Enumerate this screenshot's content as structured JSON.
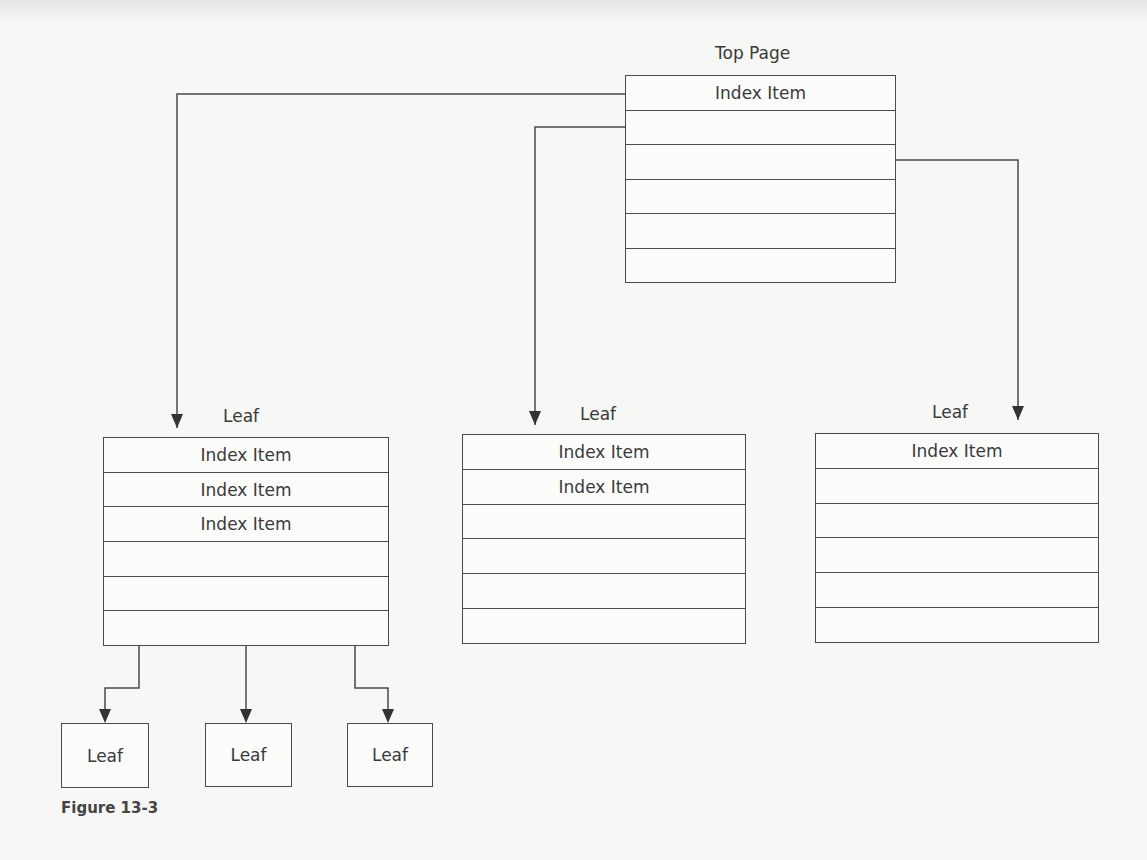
{
  "figure": {
    "caption": "Figure 13-3",
    "colors": {
      "line": "#4a4a4a",
      "text": "#3a3a3a",
      "background": "#f7f7f5"
    }
  },
  "top_page": {
    "title": "Top Page",
    "rows": [
      "Index Item",
      "",
      "",
      "",
      "",
      ""
    ]
  },
  "leaf_pages": [
    {
      "title": "Leaf",
      "rows": [
        "Index Item",
        "Index Item",
        "Index Item",
        "",
        "",
        ""
      ]
    },
    {
      "title": "Leaf",
      "rows": [
        "Index Item",
        "Index Item",
        "",
        "",
        "",
        ""
      ]
    },
    {
      "title": "Leaf",
      "rows": [
        "Index Item",
        "",
        "",
        "",
        "",
        ""
      ]
    }
  ],
  "child_leaves": [
    {
      "label": "Leaf"
    },
    {
      "label": "Leaf"
    },
    {
      "label": "Leaf"
    }
  ]
}
